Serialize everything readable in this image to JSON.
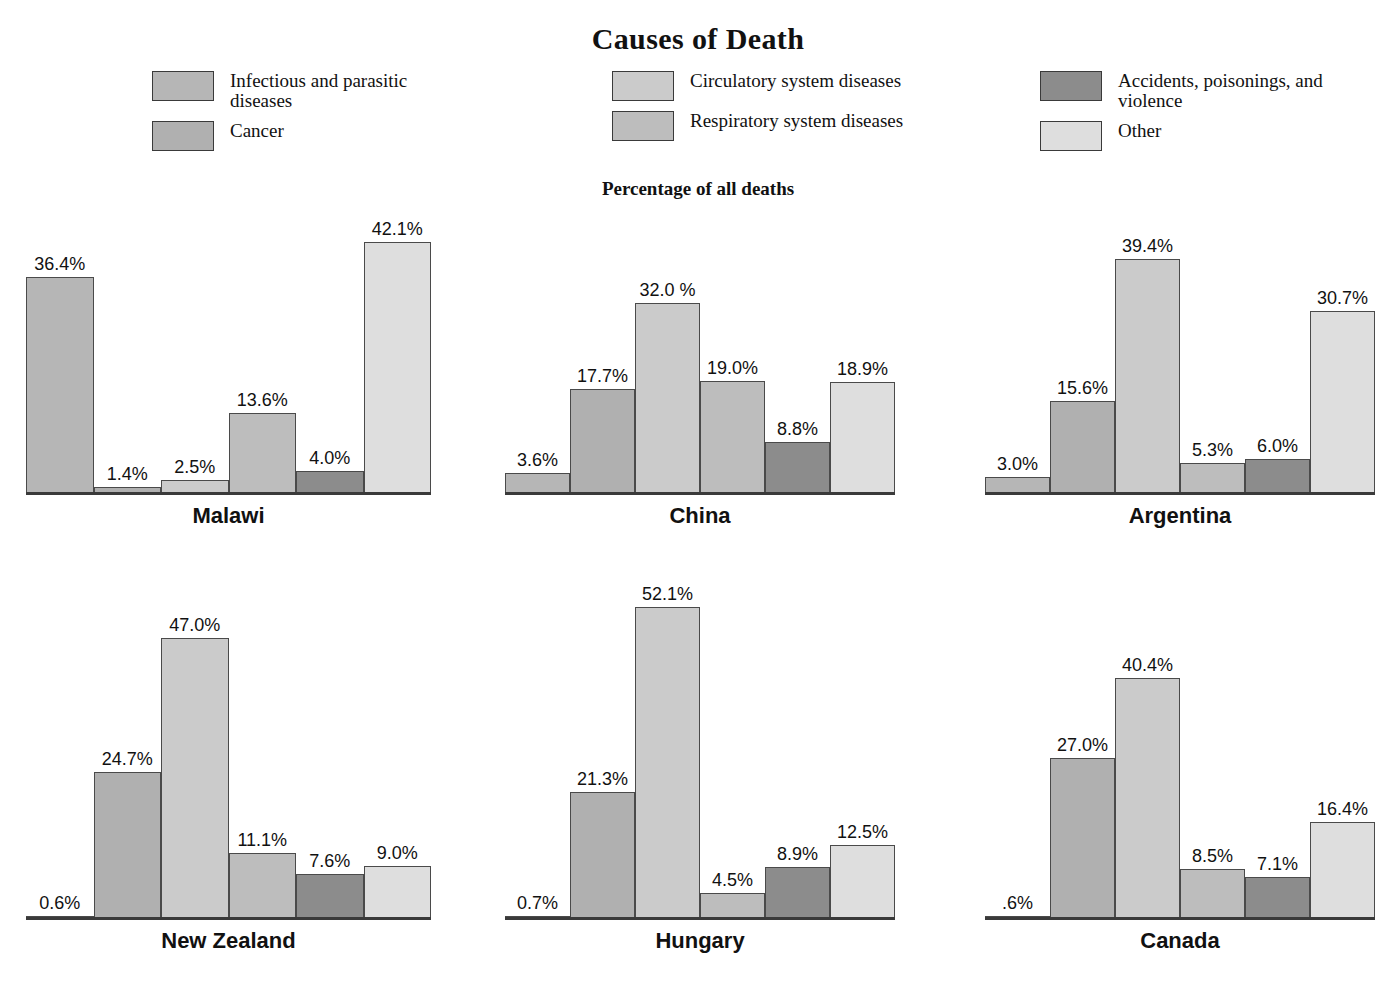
{
  "title": "Causes of Death",
  "subtitle": "Percentage of all deaths",
  "legend_groups": [
    {
      "items": [
        {
          "label": "Infectious and parasitic diseases",
          "color": "#b6b6b6"
        },
        {
          "label": "Cancer",
          "color": "#b0b0b0"
        }
      ]
    },
    {
      "items": [
        {
          "label": "Circulatory system diseases",
          "color": "#cbcbcb"
        },
        {
          "label": "Respiratory system diseases",
          "color": "#bdbdbd"
        }
      ]
    },
    {
      "items": [
        {
          "label": "Accidents, poisonings, and violence",
          "color": "#8c8c8c"
        },
        {
          "label": "Other",
          "color": "#dedede"
        }
      ]
    }
  ],
  "chart_data": {
    "type": "bar",
    "title": "Causes of Death",
    "subtitle": "Percentage of all deaths",
    "ylabel": "Percentage of all deaths",
    "xlabel": "",
    "grid": false,
    "legend_position": "top",
    "ylim": [
      0,
      55
    ],
    "categories": [
      "Infectious and parasitic diseases",
      "Cancer",
      "Circulatory system diseases",
      "Respiratory system diseases",
      "Accidents, poisonings, and violence",
      "Other"
    ],
    "category_colors": [
      "#b6b6b6",
      "#b0b0b0",
      "#cbcbcb",
      "#bdbdbd",
      "#8c8c8c",
      "#dedede"
    ],
    "series": [
      {
        "name": "Malawi",
        "values": [
          36.4,
          1.4,
          2.5,
          13.6,
          4.0,
          42.1
        ],
        "labels": [
          "36.4%",
          "1.4%",
          "2.5%",
          "13.6%",
          "4.0%",
          "42.1%"
        ]
      },
      {
        "name": "China",
        "values": [
          3.6,
          17.7,
          32.0,
          19.0,
          8.8,
          18.9
        ],
        "labels": [
          "3.6%",
          "17.7%",
          "32.0 %",
          "19.0%",
          "8.8%",
          "18.9%"
        ]
      },
      {
        "name": "Argentina",
        "values": [
          3.0,
          15.6,
          39.4,
          5.3,
          6.0,
          30.7
        ],
        "labels": [
          "3.0%",
          "15.6%",
          "39.4%",
          "5.3%",
          "6.0%",
          "30.7%"
        ]
      },
      {
        "name": "New Zealand",
        "values": [
          0.6,
          24.7,
          47.0,
          11.1,
          7.6,
          9.0
        ],
        "labels": [
          "0.6%",
          "24.7%",
          "47.0%",
          "11.1%",
          "7.6%",
          "9.0%"
        ]
      },
      {
        "name": "Hungary",
        "values": [
          0.7,
          21.3,
          52.1,
          4.5,
          8.9,
          12.5
        ],
        "labels": [
          "0.7%",
          "21.3%",
          "52.1%",
          "4.5%",
          "8.9%",
          "12.5%"
        ]
      },
      {
        "name": "Canada",
        "values": [
          0.6,
          27.0,
          40.4,
          8.5,
          7.1,
          16.4
        ],
        "labels": [
          ".6%",
          "27.0%",
          "40.4%",
          "8.5%",
          "7.1%",
          "16.4%"
        ]
      }
    ]
  },
  "panels": [
    {
      "label": "Malawi",
      "left": 26,
      "top": 165,
      "width": 405,
      "bar_width": 66
    },
    {
      "label": "China",
      "left": 505,
      "top": 165,
      "width": 390,
      "bar_width": 64
    },
    {
      "label": "Argentina",
      "left": 985,
      "top": 165,
      "width": 390,
      "bar_width": 64
    },
    {
      "label": "New Zealand",
      "left": 26,
      "top": 590,
      "width": 405,
      "bar_width": 66
    },
    {
      "label": "Hungary",
      "left": 505,
      "top": 590,
      "width": 390,
      "bar_width": 64
    },
    {
      "label": "Canada",
      "left": 985,
      "top": 590,
      "width": 390,
      "bar_width": 64
    }
  ]
}
